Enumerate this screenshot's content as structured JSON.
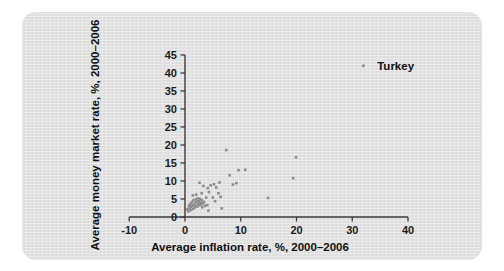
{
  "figure": {
    "panel_color": "#e3e3e3",
    "background_color": "#ffffff",
    "point_color": "#8b8b8b",
    "axis_color": "#3b3b3b",
    "text_color": "#101010"
  },
  "chart_data": {
    "type": "scatter",
    "title": "",
    "subtitle": "",
    "xlabel": "Average inflation rate, %, 2000–2006",
    "ylabel": "Average money market rate, %, 2000–2006",
    "xlim": [
      -10,
      40
    ],
    "ylim": [
      0,
      45
    ],
    "xticks": [
      -10,
      0,
      10,
      20,
      30,
      40
    ],
    "xtick_labels": [
      "-10",
      "0",
      "10",
      "20",
      "30",
      "40"
    ],
    "yticks": [
      0,
      5,
      10,
      15,
      20,
      25,
      30,
      35,
      40,
      45
    ],
    "ytick_labels": [
      "0",
      "5",
      "10",
      "15",
      "20",
      "25",
      "30",
      "35",
      "40",
      "45"
    ],
    "grid": false,
    "legend": false,
    "legend_position": "none",
    "series": [
      {
        "name": "Countries",
        "marker": "square",
        "color": "#8b8b8b",
        "points": [
          [
            0.4,
            2.1
          ],
          [
            0.6,
            1.6
          ],
          [
            0.7,
            3.0
          ],
          [
            0.8,
            2.4
          ],
          [
            0.9,
            3.6
          ],
          [
            1.0,
            1.9
          ],
          [
            1.1,
            2.8
          ],
          [
            1.2,
            4.1
          ],
          [
            1.3,
            3.2
          ],
          [
            1.4,
            2.2
          ],
          [
            1.5,
            4.6
          ],
          [
            1.6,
            3.4
          ],
          [
            1.7,
            2.6
          ],
          [
            1.8,
            3.9
          ],
          [
            1.9,
            4.9
          ],
          [
            2.0,
            3.1
          ],
          [
            2.1,
            4.3
          ],
          [
            2.2,
            2.9
          ],
          [
            2.3,
            5.2
          ],
          [
            2.4,
            3.7
          ],
          [
            2.5,
            4.4
          ],
          [
            2.6,
            3.3
          ],
          [
            2.7,
            5.0
          ],
          [
            2.8,
            4.0
          ],
          [
            2.9,
            3.5
          ],
          [
            3.0,
            4.7
          ],
          [
            3.1,
            2.7
          ],
          [
            3.2,
            3.8
          ],
          [
            3.4,
            4.2
          ],
          [
            3.6,
            3.1
          ],
          [
            3.8,
            5.4
          ],
          [
            4.0,
            3.3
          ],
          [
            1.4,
            6.0
          ],
          [
            2.0,
            6.2
          ],
          [
            2.6,
            9.5
          ],
          [
            3.3,
            8.6
          ],
          [
            3.0,
            6.6
          ],
          [
            4.1,
            8.0
          ],
          [
            4.3,
            6.9
          ],
          [
            4.6,
            8.8
          ],
          [
            5.0,
            5.4
          ],
          [
            5.2,
            9.1
          ],
          [
            5.6,
            8.2
          ],
          [
            5.4,
            4.4
          ],
          [
            6.0,
            6.6
          ],
          [
            6.2,
            9.6
          ],
          [
            6.4,
            5.6
          ],
          [
            6.6,
            2.4
          ],
          [
            4.2,
            1.8
          ],
          [
            7.4,
            18.6
          ],
          [
            8.0,
            11.6
          ],
          [
            8.6,
            9.0
          ],
          [
            9.2,
            9.4
          ],
          [
            9.6,
            13.0
          ],
          [
            10.8,
            13.1
          ],
          [
            14.9,
            5.3
          ],
          [
            19.4,
            10.8
          ],
          [
            19.9,
            16.6
          ],
          [
            32.0,
            42.0
          ]
        ]
      }
    ],
    "annotations": [
      {
        "text": "Turkey",
        "x": 32.0,
        "y": 42.0,
        "label_dx": 1.4,
        "label_dy": 0.0
      }
    ]
  }
}
